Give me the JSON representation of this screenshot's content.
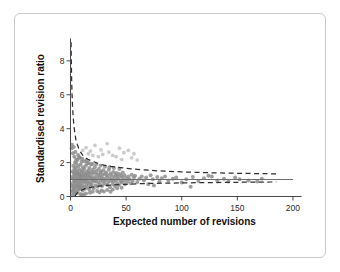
{
  "figure": {
    "frame_visible": true,
    "background_color": "#ffffff",
    "border_color": "#c9c9c9"
  },
  "chart_data": {
    "type": "scatter",
    "title": "",
    "subtitle": "",
    "xlabel": "Expected number of revisions",
    "ylabel": "Standardised revision ratio",
    "xlim": [
      0,
      205
    ],
    "ylim": [
      0,
      9.2
    ],
    "xticks": [
      0,
      50,
      100,
      150,
      200
    ],
    "yticks": [
      0,
      2,
      4,
      6,
      8
    ],
    "xtick_labels": [
      "0",
      "50",
      "100",
      "150",
      "200"
    ],
    "ytick_labels": [
      "0",
      "2",
      "4",
      "6",
      "8"
    ],
    "grid": false,
    "legend": false,
    "legend_position": "none",
    "marker_color": "#8a8a8a",
    "marker_color_light": "#c3c3c3",
    "reference_line": {
      "label": "target ratio",
      "y": 1.0,
      "x_start": 0,
      "x_end": 200,
      "style": "solid",
      "color": "#6e6e6e"
    },
    "control_limits": {
      "style": "dashed",
      "color": "#2f2f2f",
      "center": 1.0,
      "z": 1.96,
      "description": "95% funnel control limits, limit(x) = 1 +/- 1.96/sqrt(x)",
      "upper": [
        [
          0.5,
          9.1
        ],
        [
          0.7,
          8.2
        ],
        [
          1.0,
          7.0
        ],
        [
          1.4,
          6.0
        ],
        [
          1.9,
          5.2
        ],
        [
          2.5,
          4.6
        ],
        [
          3.2,
          4.1
        ],
        [
          4.0,
          3.7
        ],
        [
          5.0,
          3.3
        ],
        [
          6.2,
          3.05
        ],
        [
          7.5,
          2.82
        ],
        [
          9.0,
          2.62
        ],
        [
          11.0,
          2.44
        ],
        [
          13.0,
          2.32
        ],
        [
          15.5,
          2.2
        ],
        [
          18.0,
          2.12
        ],
        [
          21.0,
          2.05
        ],
        [
          25.0,
          1.94
        ],
        [
          30.0,
          1.85
        ],
        [
          36.0,
          1.78
        ],
        [
          43.0,
          1.72
        ],
        [
          50.0,
          1.66
        ],
        [
          60.0,
          1.6
        ],
        [
          72.0,
          1.54
        ],
        [
          85.0,
          1.49
        ],
        [
          100.0,
          1.45
        ],
        [
          120.0,
          1.41
        ],
        [
          140.0,
          1.38
        ],
        [
          160.0,
          1.36
        ],
        [
          180.0,
          1.34
        ],
        [
          185.0,
          1.33
        ]
      ],
      "lower": [
        [
          4.0,
          0.02
        ],
        [
          5.0,
          0.12
        ],
        [
          6.2,
          0.21
        ],
        [
          7.5,
          0.28
        ],
        [
          9.0,
          0.35
        ],
        [
          11.0,
          0.41
        ],
        [
          13.0,
          0.46
        ],
        [
          15.5,
          0.5
        ],
        [
          18.0,
          0.54
        ],
        [
          21.0,
          0.57
        ],
        [
          25.0,
          0.61
        ],
        [
          30.0,
          0.64
        ],
        [
          36.0,
          0.67
        ],
        [
          43.0,
          0.7
        ],
        [
          50.0,
          0.72
        ],
        [
          60.0,
          0.75
        ],
        [
          72.0,
          0.77
        ],
        [
          85.0,
          0.79
        ],
        [
          100.0,
          0.8
        ],
        [
          120.0,
          0.82
        ],
        [
          140.0,
          0.83
        ],
        [
          160.0,
          0.845
        ],
        [
          180.0,
          0.855
        ],
        [
          185.0,
          0.86
        ]
      ]
    },
    "points": [
      [
        1.2,
        0.35
      ],
      [
        1.5,
        0.62
      ],
      [
        1.6,
        1.15
      ],
      [
        1.8,
        0.08
      ],
      [
        2.0,
        1.48
      ],
      [
        2.1,
        0.78
      ],
      [
        2.3,
        0.25
      ],
      [
        2.5,
        1.82
      ],
      [
        2.6,
        1.05
      ],
      [
        2.8,
        0.55
      ],
      [
        3.0,
        1.35
      ],
      [
        3.1,
        0.42
      ],
      [
        3.3,
        0.92
      ],
      [
        3.5,
        1.62
      ],
      [
        3.6,
        0.18
      ],
      [
        3.8,
        1.22
      ],
      [
        4.0,
        0.68
      ],
      [
        4.1,
        2.02
      ],
      [
        4.3,
        1.45
      ],
      [
        4.5,
        0.88
      ],
      [
        4.6,
        0.32
      ],
      [
        4.8,
        1.72
      ],
      [
        5.0,
        1.08
      ],
      [
        5.1,
        0.52
      ],
      [
        5.3,
        1.95
      ],
      [
        5.5,
        1.28
      ],
      [
        5.6,
        0.72
      ],
      [
        5.8,
        0.22
      ],
      [
        6.0,
        1.55
      ],
      [
        6.2,
        0.95
      ],
      [
        6.3,
        2.15
      ],
      [
        6.5,
        1.38
      ],
      [
        6.7,
        0.58
      ],
      [
        6.9,
        1.12
      ],
      [
        7.0,
        0.38
      ],
      [
        7.2,
        1.78
      ],
      [
        7.4,
        0.82
      ],
      [
        7.6,
        1.32
      ],
      [
        7.8,
        0.62
      ],
      [
        8.0,
        2.32
      ],
      [
        8.1,
        1.02
      ],
      [
        8.3,
        1.58
      ],
      [
        8.5,
        0.45
      ],
      [
        8.7,
        1.25
      ],
      [
        8.9,
        0.75
      ],
      [
        9.0,
        1.88
      ],
      [
        9.2,
        1.15
      ],
      [
        9.4,
        0.52
      ],
      [
        9.6,
        1.42
      ],
      [
        9.8,
        0.92
      ],
      [
        10.0,
        2.05
      ],
      [
        10.2,
        1.18
      ],
      [
        10.4,
        0.65
      ],
      [
        10.6,
        1.52
      ],
      [
        10.8,
        1.0
      ],
      [
        11.0,
        0.35
      ],
      [
        11.2,
        1.72
      ],
      [
        11.5,
        1.22
      ],
      [
        11.8,
        0.82
      ],
      [
        12.0,
        1.38
      ],
      [
        12.2,
        0.58
      ],
      [
        12.5,
        1.62
      ],
      [
        12.8,
        1.05
      ],
      [
        13.0,
        0.45
      ],
      [
        13.2,
        1.28
      ],
      [
        13.5,
        0.88
      ],
      [
        13.8,
        1.82
      ],
      [
        14.0,
        1.12
      ],
      [
        14.3,
        0.68
      ],
      [
        14.6,
        1.45
      ],
      [
        14.8,
        0.95
      ],
      [
        15.0,
        1.95
      ],
      [
        15.3,
        1.25
      ],
      [
        15.6,
        0.55
      ],
      [
        15.9,
        1.35
      ],
      [
        16.0,
        0.78
      ],
      [
        16.3,
        1.55
      ],
      [
        16.6,
        1.08
      ],
      [
        16.9,
        0.42
      ],
      [
        17.0,
        1.68
      ],
      [
        17.3,
        1.18
      ],
      [
        17.6,
        0.85
      ],
      [
        17.9,
        1.42
      ],
      [
        18.2,
        0.62
      ],
      [
        18.5,
        1.88
      ],
      [
        18.8,
        1.12
      ],
      [
        19.0,
        0.72
      ],
      [
        19.4,
        1.32
      ],
      [
        19.7,
        0.95
      ],
      [
        20.0,
        1.58
      ],
      [
        20.4,
        1.05
      ],
      [
        20.8,
        0.48
      ],
      [
        21.0,
        1.45
      ],
      [
        21.4,
        0.88
      ],
      [
        21.8,
        1.72
      ],
      [
        22.0,
        1.15
      ],
      [
        22.5,
        0.65
      ],
      [
        22.9,
        1.35
      ],
      [
        23.2,
        0.92
      ],
      [
        23.6,
        1.52
      ],
      [
        24.0,
        1.08
      ],
      [
        24.4,
        0.58
      ],
      [
        24.8,
        1.28
      ],
      [
        25.0,
        0.82
      ],
      [
        25.5,
        1.62
      ],
      [
        26.0,
        1.18
      ],
      [
        26.4,
        0.72
      ],
      [
        26.8,
        1.38
      ],
      [
        27.0,
        0.98
      ],
      [
        27.5,
        1.48
      ],
      [
        28.0,
        1.12
      ],
      [
        28.4,
        0.62
      ],
      [
        28.8,
        1.28
      ],
      [
        29.0,
        0.88
      ],
      [
        29.5,
        1.55
      ],
      [
        30.0,
        1.05
      ],
      [
        30.5,
        0.75
      ],
      [
        31.0,
        1.32
      ],
      [
        31.5,
        0.95
      ],
      [
        32.0,
        1.42
      ],
      [
        32.5,
        1.15
      ],
      [
        33.0,
        0.68
      ],
      [
        33.5,
        1.25
      ],
      [
        34.0,
        0.85
      ],
      [
        34.5,
        1.58
      ],
      [
        35.0,
        1.08
      ],
      [
        35.5,
        0.55
      ],
      [
        36.0,
        1.35
      ],
      [
        36.5,
        0.92
      ],
      [
        37.0,
        1.22
      ],
      [
        37.5,
        1.02
      ],
      [
        38.0,
        0.72
      ],
      [
        38.5,
        1.45
      ],
      [
        39.0,
        0.88
      ],
      [
        39.5,
        1.15
      ],
      [
        40.0,
        0.62
      ],
      [
        40.5,
        1.28
      ],
      [
        41.0,
        0.98
      ],
      [
        41.5,
        1.38
      ],
      [
        42.0,
        0.78
      ],
      [
        42.5,
        1.18
      ],
      [
        43.0,
        1.05
      ],
      [
        43.5,
        0.68
      ],
      [
        44.0,
        1.32
      ],
      [
        45.0,
        0.92
      ],
      [
        45.5,
        1.22
      ],
      [
        46.0,
        0.82
      ],
      [
        46.5,
        1.12
      ],
      [
        47.0,
        1.42
      ],
      [
        48.0,
        0.95
      ],
      [
        48.5,
        1.25
      ],
      [
        49.0,
        0.72
      ],
      [
        50.0,
        1.08
      ],
      [
        51.0,
        0.88
      ],
      [
        52.0,
        1.18
      ],
      [
        53.0,
        1.02
      ],
      [
        54.0,
        0.78
      ],
      [
        55.0,
        1.28
      ],
      [
        56.0,
        0.92
      ],
      [
        57.0,
        1.12
      ],
      [
        58.0,
        1.22
      ],
      [
        60.0,
        0.85
      ],
      [
        62.0,
        1.05
      ],
      [
        64.0,
        1.18
      ],
      [
        66.0,
        0.95
      ],
      [
        68.0,
        1.12
      ],
      [
        70.0,
        0.72
      ],
      [
        72.0,
        1.25
      ],
      [
        74.0,
        1.02
      ],
      [
        75.0,
        0.65
      ],
      [
        78.0,
        1.15
      ],
      [
        80.0,
        0.88
      ],
      [
        82.0,
        1.08
      ],
      [
        85.0,
        1.18
      ],
      [
        88.0,
        0.95
      ],
      [
        92.0,
        1.05
      ],
      [
        95.0,
        1.12
      ],
      [
        100.0,
        0.82
      ],
      [
        104.0,
        1.02
      ],
      [
        108.0,
        0.58
      ],
      [
        110.0,
        1.15
      ],
      [
        115.0,
        0.92
      ],
      [
        120.0,
        1.08
      ],
      [
        124.0,
        1.22
      ],
      [
        127.0,
        1.18
      ],
      [
        132.0,
        0.95
      ],
      [
        138.0,
        1.05
      ],
      [
        142.0,
        0.88
      ],
      [
        148.0,
        1.12
      ],
      [
        152.0,
        1.02
      ],
      [
        160.0,
        0.95
      ],
      [
        168.0,
        0.88
      ],
      [
        172.0,
        1.05
      ],
      [
        2.2,
        2.55
      ],
      [
        3.4,
        2.35
      ],
      [
        4.4,
        2.62
      ],
      [
        5.2,
        2.18
      ],
      [
        6.8,
        2.45
      ],
      [
        8.2,
        2.28
      ],
      [
        10.5,
        2.22
      ],
      [
        12.6,
        2.08
      ],
      [
        14.5,
        2.12
      ],
      [
        16.5,
        1.98
      ],
      [
        19.5,
        1.92
      ],
      [
        23.0,
        1.88
      ],
      [
        27.0,
        1.82
      ],
      [
        31.0,
        1.75
      ],
      [
        35.0,
        1.72
      ],
      [
        39.0,
        1.68
      ],
      [
        44.0,
        1.62
      ],
      [
        1.0,
        2.85
      ],
      [
        1.3,
        3.05
      ],
      [
        2.9,
        2.92
      ],
      [
        12.0,
        0.12
      ],
      [
        14.0,
        0.18
      ],
      [
        17.5,
        0.22
      ],
      [
        20.0,
        0.28
      ],
      [
        24.0,
        0.32
      ],
      [
        28.0,
        0.35
      ],
      [
        33.0,
        0.38
      ],
      [
        38.0,
        0.42
      ],
      [
        42.0,
        0.48
      ],
      [
        46.0,
        0.52
      ],
      [
        8.8,
        0.15
      ],
      [
        10.2,
        0.08
      ],
      [
        26.0,
        0.25
      ],
      [
        30.0,
        0.3
      ],
      [
        36.0,
        0.28
      ]
    ],
    "points_light": [
      [
        22.0,
        3.02
      ],
      [
        27.5,
        2.75
      ],
      [
        33.0,
        3.12
      ],
      [
        34.5,
        2.62
      ],
      [
        38.0,
        2.42
      ],
      [
        44.0,
        2.85
      ],
      [
        48.0,
        2.58
      ],
      [
        52.0,
        2.72
      ],
      [
        57.0,
        2.52
      ],
      [
        18.0,
        2.68
      ],
      [
        14.0,
        2.88
      ],
      [
        41.0,
        2.35
      ],
      [
        29.0,
        2.48
      ],
      [
        25.0,
        2.35
      ],
      [
        20.0,
        2.42
      ],
      [
        46.0,
        2.18
      ],
      [
        55.0,
        2.28
      ],
      [
        60.0,
        2.15
      ],
      [
        16.0,
        2.52
      ],
      [
        11.0,
        2.72
      ]
    ]
  }
}
